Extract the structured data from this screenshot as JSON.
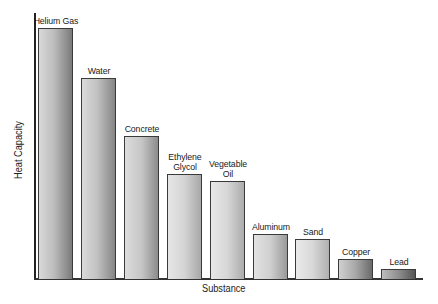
{
  "chart_data": {
    "type": "bar",
    "title": "",
    "xlabel": "Substance",
    "ylabel": "Heat Capacity",
    "ylim": [
      0,
      100
    ],
    "grid": false,
    "legend": null,
    "value_note": "No numeric ticks shown; values are relative bar heights (Helium Gas = 100)",
    "categories": [
      "Helium Gas",
      "Water",
      "Concrete",
      "Ethylene Glycol",
      "Vegetable Oil",
      "Aluminum",
      "Sand",
      "Copper",
      "Lead"
    ],
    "labels_display": [
      "Helium Gas",
      "Water",
      "Concrete",
      "Ethylene\nGlycol",
      "Vegetable\nOil",
      "Aluminum",
      "Sand",
      "Copper",
      "Lead"
    ],
    "values": [
      100,
      80,
      57,
      42,
      39,
      18,
      16,
      8,
      4
    ]
  },
  "axes": {
    "x_label": "Substance",
    "y_label": "Heat Capacity"
  }
}
